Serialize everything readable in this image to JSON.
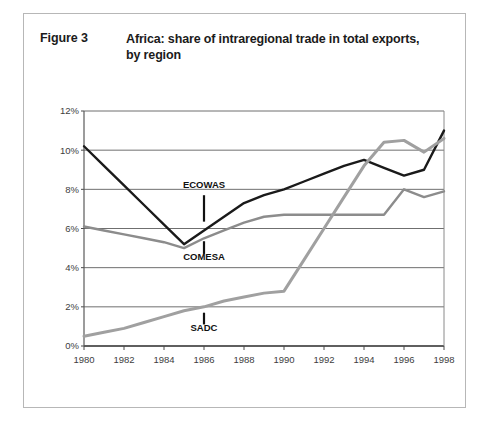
{
  "figure": {
    "label": "Figure 3",
    "title": "Africa: share of intraregional trade in total exports, by region"
  },
  "chart_data": {
    "type": "line",
    "title": "Africa: share of intraregional trade in total exports, by region",
    "xlabel": "",
    "ylabel": "",
    "xlim": [
      1980,
      1998
    ],
    "ylim": [
      0,
      12
    ],
    "ytick_labels": [
      "0%",
      "2%",
      "4%",
      "6%",
      "8%",
      "10%",
      "12%"
    ],
    "ytick_values": [
      0,
      2,
      4,
      6,
      8,
      10,
      12
    ],
    "xtick_labels": [
      "1980",
      "1982",
      "1984",
      "1986",
      "1988",
      "1990",
      "1992",
      "1994",
      "1996",
      "1998"
    ],
    "xtick_values": [
      1980,
      1982,
      1984,
      1986,
      1988,
      1990,
      1992,
      1994,
      1996,
      1998
    ],
    "grid": true,
    "legend": "inline-annotations",
    "x": [
      1980,
      1981,
      1982,
      1983,
      1984,
      1985,
      1986,
      1987,
      1988,
      1989,
      1990,
      1991,
      1992,
      1993,
      1994,
      1995,
      1996,
      1997,
      1998
    ],
    "series": [
      {
        "name": "ECOWAS",
        "color": "#1a1a1a",
        "width": 2.4,
        "values": [
          10.2,
          9.2,
          8.2,
          7.2,
          6.2,
          5.2,
          5.9,
          6.6,
          7.3,
          7.7,
          8.0,
          8.4,
          8.8,
          9.2,
          9.5,
          9.1,
          8.7,
          9.0,
          11.0
        ]
      },
      {
        "name": "COMESA",
        "color": "#8c8c8c",
        "width": 2.4,
        "values": [
          6.1,
          5.9,
          5.7,
          5.5,
          5.3,
          5.0,
          5.5,
          5.9,
          6.3,
          6.6,
          6.7,
          6.7,
          6.7,
          6.7,
          6.7,
          6.7,
          8.0,
          7.6,
          7.9
        ]
      },
      {
        "name": "SADC",
        "color": "#a0a0a0",
        "width": 3.0,
        "values": [
          0.5,
          0.7,
          0.9,
          1.2,
          1.5,
          1.8,
          2.0,
          2.3,
          2.5,
          2.7,
          2.8,
          4.4,
          6.0,
          7.6,
          9.2,
          10.4,
          10.5,
          9.9,
          10.6
        ]
      }
    ],
    "annotations": [
      {
        "label": "ECOWAS",
        "x": 1986,
        "text_y": 8.05,
        "leader_from_y": 7.7,
        "leader_to_y": 6.35
      },
      {
        "label": "COMESA",
        "x": 1986,
        "text_y": 4.4,
        "leader_from_y": 5.35,
        "leader_to_y": 4.7
      },
      {
        "label": "SADC",
        "x": 1986,
        "text_y": 0.75,
        "leader_from_y": 1.7,
        "leader_to_y": 1.1
      }
    ]
  }
}
